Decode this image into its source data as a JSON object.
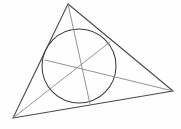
{
  "figure": {
    "canvas": {
      "width": 181,
      "height": 129
    },
    "background_color": "#fefefe"
  },
  "chart_data": {
    "type": "diagram",
    "xlabel": "",
    "ylabel": "",
    "xlim": [
      0,
      181
    ],
    "ylim": [
      0,
      129
    ],
    "grid": false,
    "legend": false,
    "triangle": {
      "label": "outer-triangle",
      "stroke": "#4a4a4a",
      "stroke_width": 1.1,
      "vertices": [
        {
          "name": "A",
          "x": 68,
          "y": 4
        },
        {
          "name": "B",
          "x": 13,
          "y": 118
        },
        {
          "name": "C",
          "x": 173,
          "y": 91
        }
      ],
      "edges": [
        {
          "name": "edge-AC",
          "from": "A",
          "to": "C"
        },
        {
          "name": "edge-AB",
          "from": "A",
          "to": "B"
        },
        {
          "name": "edge-BC",
          "from": "B",
          "to": "C"
        }
      ]
    },
    "incircle": {
      "label": "incircle",
      "center": {
        "x": 79,
        "y": 66
      },
      "radius": 37,
      "stroke": "#3d3d3d",
      "stroke_width": 1.05,
      "fill": "none"
    },
    "contact_points": [
      {
        "name": "touch-AC",
        "on_edge": "edge-AC",
        "x": 110,
        "y": 42
      },
      {
        "name": "touch-AB",
        "on_edge": "edge-AB",
        "x": 45,
        "y": 60
      },
      {
        "name": "touch-BC",
        "on_edge": "edge-BC",
        "x": 90,
        "y": 104
      }
    ],
    "cevians": [
      {
        "name": "cevian-A",
        "from": {
          "x": 68,
          "y": 4
        },
        "to": {
          "x": 90,
          "y": 104
        },
        "stroke": "#8d8d8d"
      },
      {
        "name": "cevian-B",
        "from": {
          "x": 13,
          "y": 118
        },
        "to": {
          "x": 110,
          "y": 42
        },
        "stroke": "#8d8d8d"
      },
      {
        "name": "cevian-C",
        "from": {
          "x": 173,
          "y": 91
        },
        "to": {
          "x": 45,
          "y": 60
        },
        "stroke": "#8d8d8d"
      }
    ],
    "concurrency_point": {
      "name": "gergonne-point",
      "x": 79,
      "y": 67
    }
  }
}
